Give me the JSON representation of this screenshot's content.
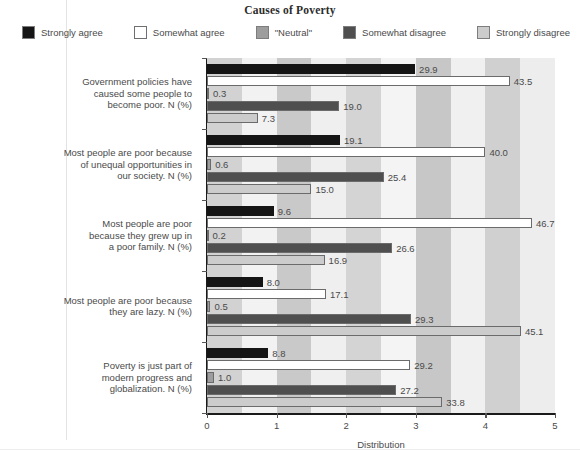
{
  "chart": {
    "title": "Causes of Poverty",
    "axis_caption": "Distribution"
  },
  "legend": {
    "items": [
      {
        "label": "Strongly agree",
        "color": "#151515"
      },
      {
        "label": "Somewhat agree",
        "color": "#ffffff"
      },
      {
        "label": "\"Neutral\"",
        "color": "#9d9d9d"
      },
      {
        "label": "Somewhat disagree",
        "color": "#4f4f4f"
      },
      {
        "label": "Strongly disagree",
        "color": "#cccccc"
      }
    ]
  },
  "chart_data": {
    "type": "bar",
    "orientation": "horizontal",
    "title": "Causes of Poverty",
    "xlabel": "Distribution",
    "ylabel": "",
    "xlim": [
      0,
      5
    ],
    "xticks": [
      "0",
      "1",
      "2",
      "3",
      "4",
      "5"
    ],
    "grid": false,
    "legend_position": "top",
    "categories": [
      "Government policies have caused some people to become poor. N (%)",
      "Most people are poor because of unequal opportunities in our society. N (%)",
      "Most people are poor because they grew up in a poor family. N (%)",
      "Most people are poor because they are lazy. N (%)",
      "Poverty is just part of modern progress and globalization. N (%)"
    ],
    "category_lines": [
      [
        "Government policies have",
        "caused some people to",
        "become poor. N (%)"
      ],
      [
        "Most people are poor because",
        "of unequal opportunities in",
        "our society. N (%)"
      ],
      [
        "Most people are poor",
        "because they grew up in",
        "a poor family. N (%)"
      ],
      [
        "Most people are poor because",
        "they are lazy. N (%)"
      ],
      [
        "Poverty is just part of",
        "modern progress and",
        "globalization. N (%)"
      ]
    ],
    "series": [
      {
        "name": "Strongly agree",
        "color": "#151515",
        "values": [
          29.9,
          19.1,
          9.6,
          8.0,
          8.8
        ]
      },
      {
        "name": "Somewhat agree",
        "color": "#ffffff",
        "values": [
          43.5,
          40.0,
          46.7,
          17.1,
          29.2
        ]
      },
      {
        "name": "\"Neutral\"",
        "color": "#9d9d9d",
        "values": [
          0.3,
          0.6,
          0.2,
          0.5,
          1.0
        ]
      },
      {
        "name": "Somewhat disagree",
        "color": "#4f4f4f",
        "values": [
          19.0,
          25.4,
          26.6,
          29.3,
          27.2
        ]
      },
      {
        "name": "Strongly disagree",
        "color": "#cccccc",
        "values": [
          7.3,
          15.0,
          16.9,
          45.1,
          33.8
        ]
      }
    ],
    "value_labels": [
      [
        "29.9",
        "43.5",
        "0.3",
        "19.0",
        "7.3"
      ],
      [
        "19.1",
        "40.0",
        "0.6",
        "25.4",
        "15.0"
      ],
      [
        "9.6",
        "46.7",
        "0.2",
        "26.6",
        "16.9"
      ],
      [
        "8.0",
        "17.1",
        "0.5",
        "29.3",
        "45.1"
      ],
      [
        "8.8",
        "29.2",
        "1.0",
        "27.2",
        "33.8"
      ]
    ],
    "value_scale_note": "bar length = value/10 on a 0-5 axis"
  }
}
